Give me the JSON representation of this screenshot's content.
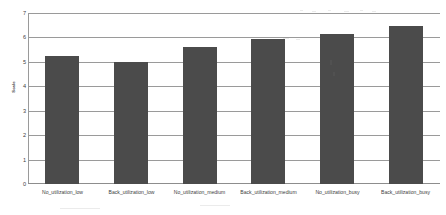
{
  "chart_data": {
    "type": "bar",
    "title": "",
    "xlabel": "",
    "ylabel": "Scale",
    "ylim": [
      0,
      7
    ],
    "grid": true,
    "legend": "none",
    "orientation": "vertical",
    "bar_color": "#4b4b4b",
    "background_color": "#ffffff",
    "gridline_color": "#9a9a9a",
    "categories": [
      "No_utilization_low",
      "Back_utilization_low",
      "No_utilization_medium",
      "Back_utilization_medium",
      "No_utilization_busy",
      "Back_utilization_busy"
    ],
    "values": [
      5.25,
      5.0,
      5.6,
      5.95,
      6.15,
      6.45
    ],
    "y_ticks": [
      0,
      1,
      2,
      3,
      4,
      5,
      6,
      7
    ],
    "y_tick_labels": [
      "0",
      "1",
      "2",
      "3",
      "4",
      "5",
      "6",
      "7"
    ]
  }
}
